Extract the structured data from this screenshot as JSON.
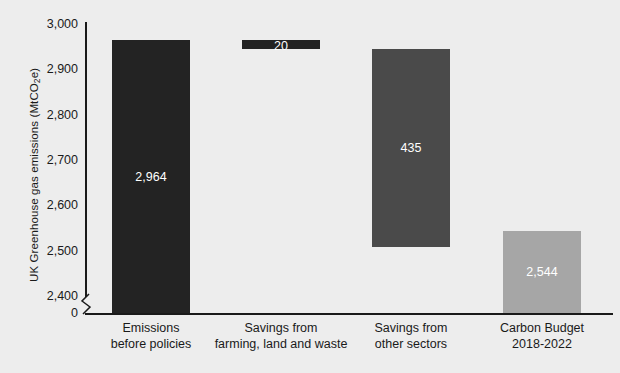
{
  "chart_data": {
    "type": "bar",
    "chart_style": "waterfall",
    "title": "",
    "xlabel": "",
    "ylabel": "UK Greenhouse gas emissions (MtCO2e)",
    "ylabel_prefix": "UK Greenhouse gas emissions (MtCO",
    "ylabel_sub": "2",
    "ylabel_suffix": "e)",
    "ylim": [
      2400,
      3000
    ],
    "axis_break": true,
    "axis_break_label": "0",
    "grid": false,
    "legend": false,
    "ytick_labels": [
      "3,000",
      "2,900",
      "2,800",
      "2,700",
      "2,600",
      "2,500",
      "2,400",
      "0"
    ],
    "ytick_values": [
      3000,
      2900,
      2800,
      2700,
      2600,
      2500,
      2400,
      0
    ],
    "categories": [
      "Emissions before policies",
      "Savings from farming, land and waste",
      "Savings from other sectors",
      "Carbon Budget 2018-2022"
    ],
    "category_lines": [
      [
        "Emissions",
        "before policies"
      ],
      [
        "Savings from",
        "farming, land and waste"
      ],
      [
        "Savings from",
        "other sectors"
      ],
      [
        "Carbon Budget",
        "2018-2022"
      ]
    ],
    "values": [
      2964,
      20,
      435,
      2544
    ],
    "value_labels": [
      "2,964",
      "20",
      "435",
      "2,544"
    ],
    "bars": [
      {
        "name": "emissions-before-policies",
        "label": "2,964",
        "value": 2964,
        "base": 2400,
        "top": 2964,
        "color": "#232323"
      },
      {
        "name": "savings-farming-land-waste",
        "label": "20",
        "value": 20,
        "base": 2944,
        "top": 2964,
        "color": "#232323"
      },
      {
        "name": "savings-other-sectors",
        "label": "435",
        "value": 435,
        "base": 2509,
        "top": 2944,
        "color": "#4a4a4a"
      },
      {
        "name": "carbon-budget-2018-2022",
        "label": "2,544",
        "value": 2544,
        "base": 2400,
        "top": 2544,
        "color": "#a6a6a6"
      }
    ]
  },
  "colors": {
    "background": "#ededed",
    "axis": "#1a1a1a",
    "text": "#1a1a1a",
    "bar_dark": "#232323",
    "bar_mid": "#4a4a4a",
    "bar_light": "#a6a6a6",
    "value_text": "#ffffff"
  }
}
